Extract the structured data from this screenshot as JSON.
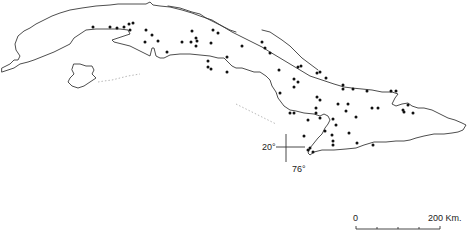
{
  "map": {
    "region": "Cuba",
    "style": "black-and-white outline map with point markers",
    "colors": {
      "background": "#ffffff",
      "coastline": "#3a3a3a",
      "markers": "#111111",
      "text": "#222222"
    },
    "graticule": {
      "latitude_label": "20°",
      "longitude_label": "76°"
    },
    "scale_bar": {
      "start_label": "0",
      "end_label": "200 Km.",
      "ticks": 4
    },
    "markers": [
      {
        "x": 93,
        "y": 27
      },
      {
        "x": 110,
        "y": 27
      },
      {
        "x": 117,
        "y": 28
      },
      {
        "x": 124,
        "y": 27
      },
      {
        "x": 129,
        "y": 24
      },
      {
        "x": 133,
        "y": 23
      },
      {
        "x": 130,
        "y": 30
      },
      {
        "x": 146,
        "y": 30
      },
      {
        "x": 152,
        "y": 35
      },
      {
        "x": 145,
        "y": 42
      },
      {
        "x": 158,
        "y": 41
      },
      {
        "x": 167,
        "y": 52
      },
      {
        "x": 182,
        "y": 42
      },
      {
        "x": 192,
        "y": 31
      },
      {
        "x": 191,
        "y": 42
      },
      {
        "x": 196,
        "y": 38
      },
      {
        "x": 197,
        "y": 41
      },
      {
        "x": 196,
        "y": 46
      },
      {
        "x": 213,
        "y": 30
      },
      {
        "x": 211,
        "y": 43
      },
      {
        "x": 218,
        "y": 33
      },
      {
        "x": 208,
        "y": 61
      },
      {
        "x": 208,
        "y": 67
      },
      {
        "x": 211,
        "y": 69
      },
      {
        "x": 227,
        "y": 57
      },
      {
        "x": 227,
        "y": 72
      },
      {
        "x": 242,
        "y": 46
      },
      {
        "x": 262,
        "y": 42
      },
      {
        "x": 265,
        "y": 48
      },
      {
        "x": 270,
        "y": 53
      },
      {
        "x": 279,
        "y": 70
      },
      {
        "x": 298,
        "y": 67
      },
      {
        "x": 301,
        "y": 66
      },
      {
        "x": 294,
        "y": 79
      },
      {
        "x": 294,
        "y": 87
      },
      {
        "x": 298,
        "y": 82
      },
      {
        "x": 280,
        "y": 93
      },
      {
        "x": 317,
        "y": 73
      },
      {
        "x": 320,
        "y": 72
      },
      {
        "x": 326,
        "y": 78
      },
      {
        "x": 343,
        "y": 85
      },
      {
        "x": 343,
        "y": 89
      },
      {
        "x": 353,
        "y": 89
      },
      {
        "x": 367,
        "y": 91
      },
      {
        "x": 317,
        "y": 97
      },
      {
        "x": 320,
        "y": 100
      },
      {
        "x": 338,
        "y": 104
      },
      {
        "x": 348,
        "y": 104
      },
      {
        "x": 346,
        "y": 111
      },
      {
        "x": 290,
        "y": 113
      },
      {
        "x": 294,
        "y": 113
      },
      {
        "x": 316,
        "y": 113
      },
      {
        "x": 316,
        "y": 108
      },
      {
        "x": 320,
        "y": 118
      },
      {
        "x": 333,
        "y": 119
      },
      {
        "x": 332,
        "y": 135
      },
      {
        "x": 333,
        "y": 141
      },
      {
        "x": 356,
        "y": 117
      },
      {
        "x": 372,
        "y": 108
      },
      {
        "x": 378,
        "y": 108
      },
      {
        "x": 391,
        "y": 91
      },
      {
        "x": 396,
        "y": 91
      },
      {
        "x": 403,
        "y": 110
      },
      {
        "x": 404,
        "y": 112
      },
      {
        "x": 413,
        "y": 113
      },
      {
        "x": 408,
        "y": 105
      },
      {
        "x": 325,
        "y": 131
      },
      {
        "x": 333,
        "y": 145
      },
      {
        "x": 304,
        "y": 136
      },
      {
        "x": 357,
        "y": 143
      },
      {
        "x": 310,
        "y": 148
      },
      {
        "x": 313,
        "y": 152
      },
      {
        "x": 336,
        "y": 125
      },
      {
        "x": 349,
        "y": 133
      },
      {
        "x": 373,
        "y": 145
      },
      {
        "x": 308,
        "y": 120
      },
      {
        "x": 308,
        "y": 150
      }
    ]
  }
}
